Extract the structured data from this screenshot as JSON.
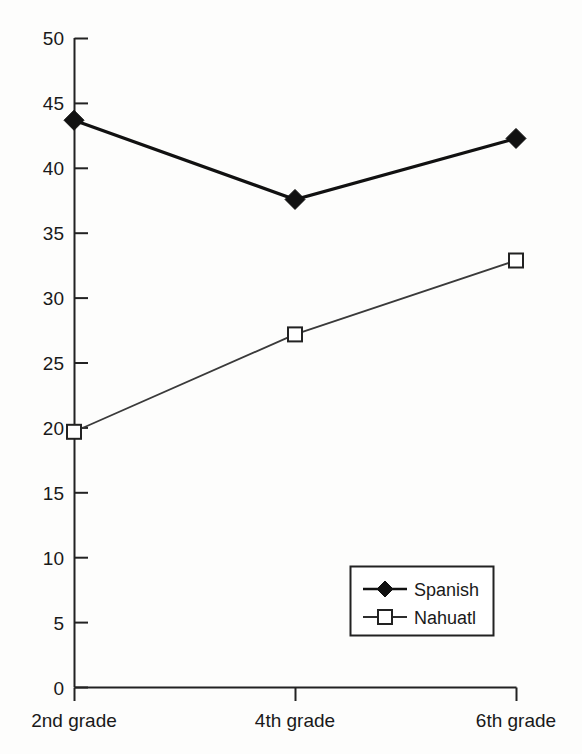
{
  "chart_data": {
    "type": "line",
    "title": "",
    "subtitle": "",
    "xlabel": "",
    "ylabel": "",
    "categories": [
      "2nd grade",
      "4th grade",
      "6th grade"
    ],
    "series": [
      {
        "name": "Spanish",
        "values": [
          43.7,
          37.6,
          42.3
        ],
        "marker": "filled-diamond",
        "color": "#111111",
        "line_width": 3
      },
      {
        "name": "Nahuatl",
        "values": [
          19.7,
          27.2,
          32.9
        ],
        "marker": "open-square",
        "color": "#3a3a3a",
        "line_width": 1.6
      }
    ],
    "ylim": [
      0,
      50
    ],
    "ytick_step": 5,
    "yticks": [
      "0",
      "5",
      "10",
      "15",
      "20",
      "25",
      "30",
      "35",
      "40",
      "45",
      "50"
    ],
    "grid": false,
    "legend_position": "bottom-right",
    "axis_color": "#222222",
    "background": "#fdfdfc"
  },
  "legend": {
    "entries": [
      {
        "label": "Spanish",
        "marker": "filled-diamond-icon"
      },
      {
        "label": "Nahuatl",
        "marker": "open-square-icon"
      }
    ]
  },
  "axes": {
    "y_tick_labels": [
      "50",
      "45",
      "40",
      "35",
      "30",
      "25",
      "20",
      "15",
      "10",
      "5",
      "0"
    ],
    "x_tick_labels": [
      "2nd grade",
      "4th grade",
      "6th grade"
    ]
  }
}
